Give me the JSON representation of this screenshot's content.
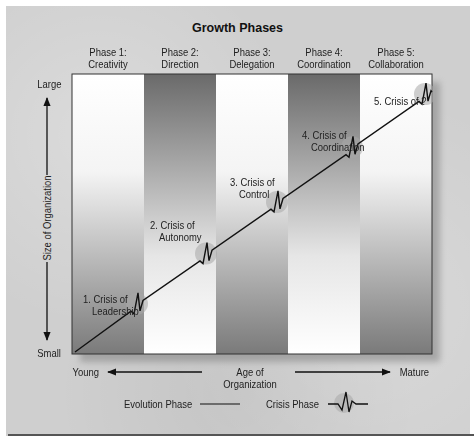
{
  "title": "Growth Phases",
  "phases": [
    {
      "line1": "Phase 1:",
      "line2": "Creativity"
    },
    {
      "line1": "Phase 2:",
      "line2": "Direction"
    },
    {
      "line1": "Phase 3:",
      "line2": "Delegation"
    },
    {
      "line1": "Phase 4:",
      "line2": "Coordination"
    },
    {
      "line1": "Phase 5:",
      "line2": "Collaboration"
    }
  ],
  "crises": [
    {
      "line1": "1. Crisis of",
      "line2": "Leadership"
    },
    {
      "line1": "2. Crisis of",
      "line2": "Autonomy"
    },
    {
      "line1": "3. Crisis of",
      "line2": "Control"
    },
    {
      "line1": "4. Crisis of",
      "line2": "Coordination"
    },
    {
      "line1": "5. Crisis of ?",
      "line2": ""
    }
  ],
  "y_axis": {
    "top": "Large",
    "bottom": "Small",
    "label": "Size of Organization"
  },
  "x_axis": {
    "left": "Young",
    "right": "Mature",
    "label": "Age of Organization"
  },
  "legend": {
    "evolution": "Evolution Phase",
    "crisis": "Crisis Phase"
  },
  "colors": {
    "dark_band": "#6e6e6e",
    "light_band": "#ffffff",
    "line": "#111111",
    "crisis_circle": "#a8a8a8",
    "panel": "#cfcfcf"
  }
}
